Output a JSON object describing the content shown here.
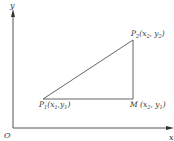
{
  "diagram": {
    "axes": {
      "x_label": "x",
      "y_label": "y",
      "origin_label": "O"
    },
    "points": {
      "p1": {
        "name": "P",
        "sub": "1",
        "coords": "(x",
        "coords_x_sub": "1",
        "comma": ",y",
        "coords_y_sub": "1",
        "close": ")"
      },
      "p2": {
        "name": "P",
        "sub": "2",
        "coords": "(x",
        "coords_x_sub": "2",
        "comma": ", y",
        "coords_y_sub": "2",
        "close": ")"
      },
      "m": {
        "name": "M",
        "coords": " (x",
        "coords_x_sub": "2",
        "comma": ", y",
        "coords_y_sub": "1",
        "close": ")"
      }
    },
    "colors": {
      "line": "#555555",
      "text": "#333333",
      "background": "#ffffff"
    }
  }
}
